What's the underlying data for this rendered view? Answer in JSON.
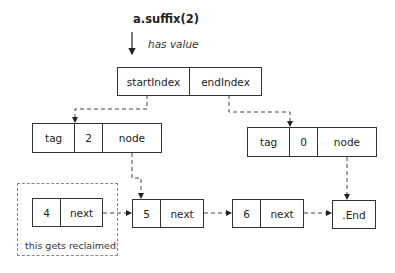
{
  "diagram": {
    "call_label": "a.suffix(2)",
    "call_arrow_label": "has value",
    "substring": {
      "fields": [
        "startIndex",
        "endIndex"
      ]
    },
    "start_index": {
      "fields": [
        "tag",
        "2",
        "node"
      ]
    },
    "end_index": {
      "fields": [
        "tag",
        "0",
        "node"
      ]
    },
    "linked_list": [
      {
        "value": "4",
        "next": "next"
      },
      {
        "value": "5",
        "next": "next"
      },
      {
        "value": "6",
        "next": "next"
      }
    ],
    "end_node": ".End",
    "reclaim_label": "this gets reclaimed",
    "colors": {
      "line": "#333333",
      "dashed_region": "#888888"
    }
  }
}
